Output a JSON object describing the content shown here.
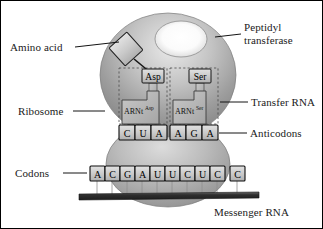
{
  "figure": {
    "background_color": "#ffffff",
    "border_color": "#000000"
  },
  "labels": {
    "amino_acid": "Amino acid",
    "peptidyl_transferase_line1": "Peptidyl",
    "peptidyl_transferase_line2": "transferase",
    "ribosome": "Ribosome",
    "transfer_rna": "Transfer RNA",
    "anticodons": "Anticodons",
    "codons": "Codons",
    "messenger_rna": "Messenger RNA"
  },
  "trna": [
    {
      "amino_acid_label": "Asp",
      "body_label": "ARNt",
      "body_superscript": "Asp",
      "anticodon": [
        "C",
        "U",
        "A"
      ]
    },
    {
      "amino_acid_label": "Ser",
      "body_label": "ARNt",
      "body_superscript": "Ser",
      "anticodon": [
        "A",
        "G",
        "A"
      ]
    }
  ],
  "anticodon_sequence": [
    "C",
    "U",
    "A",
    "A",
    "G",
    "A"
  ],
  "codon_sequence": [
    "A",
    "C",
    "G",
    "A",
    "U",
    "U",
    "C",
    "U",
    "C",
    "C"
  ],
  "colors": {
    "ribosome_large_subunit": "#9a9a9a",
    "ribosome_small_subunit": "#a8a8a8",
    "ribosome_highlight": "#fdfdfd",
    "box_fill": "#cfcfcf",
    "box_stroke": "#111111",
    "mrna_bar": "#3a3a3a",
    "trna_body": "#b5b5b5",
    "label_text": "#1a1a1a",
    "leader_line": "#111111"
  },
  "icons": {
    "amino_acid_shape": "diamond-icon",
    "peptidyl_site_shape": "ellipse-icon",
    "mrna_strand": "bar-icon"
  }
}
